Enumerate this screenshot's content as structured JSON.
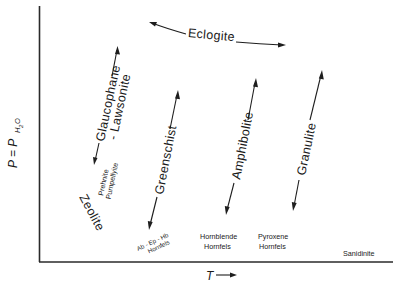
{
  "diagram": {
    "title": "",
    "axes": {
      "y_label": "P = P",
      "y_label_subscript_H": "H",
      "y_label_subscript_2": "2",
      "y_label_subscript_O": "O",
      "y_label_full": "P = P_H2O",
      "x_label": "T",
      "x_arrow": "→"
    },
    "facies": [
      {
        "id": "eclogite",
        "label": "Eclogite"
      },
      {
        "id": "glaucophane-lawsonite",
        "label_line1": "Glaucophane",
        "label_line2": "- Lawsonite"
      },
      {
        "id": "prehnite-pumpellyite",
        "label_line1": "Prehnite",
        "label_line2": "Pumpellyite"
      },
      {
        "id": "zeolite",
        "label": "Zeolite"
      },
      {
        "id": "greenschist",
        "label": "Greenschist"
      },
      {
        "id": "ab-ep-hb-hornfels",
        "label_line1": "Ab - Ep - Hb",
        "label_line2": "Hornfels"
      },
      {
        "id": "amphibolite",
        "label": "Amphibolite"
      },
      {
        "id": "hornblende-hornfels",
        "label_line1": "Hornblende",
        "label_line2": "Hornfels"
      },
      {
        "id": "pyroxene-hornfels",
        "label_line1": "Pyroxene",
        "label_line2": "Hornfels"
      },
      {
        "id": "granulite",
        "label": "Granulite"
      },
      {
        "id": "sanidinite",
        "label": "Sanidinite"
      }
    ],
    "colors": {
      "ink": "#1a1a1a",
      "background": "#ffffff"
    }
  }
}
